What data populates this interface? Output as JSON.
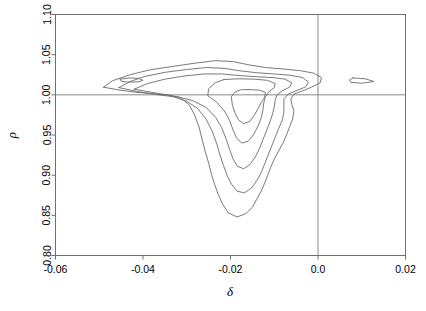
{
  "chart_data": {
    "type": "line",
    "subtype": "contour",
    "title": "",
    "xlabel": "δ",
    "ylabel": "ρ",
    "xlim": [
      -0.06,
      0.02
    ],
    "ylim": [
      0.8,
      1.1
    ],
    "grid": false,
    "legend": "none",
    "xticks": [
      -0.06,
      -0.04,
      -0.02,
      0.0,
      0.02
    ],
    "xticklabels": [
      "-0.06",
      "-0.04",
      "-0.02",
      "0.0",
      "0.02"
    ],
    "yticks": [
      0.8,
      0.85,
      0.9,
      0.95,
      1.0,
      1.05,
      1.1
    ],
    "yticklabels": [
      "0.80",
      "0.85",
      "0.90",
      "0.95",
      "1.00",
      "1.05",
      "1.10"
    ],
    "reference_lines": [
      {
        "orientation": "horizontal",
        "value": 1.0,
        "axis": "rho"
      },
      {
        "orientation": "vertical",
        "value": 0.0,
        "axis": "delta"
      }
    ],
    "contour_levels": [
      1,
      2,
      3,
      4,
      5
    ],
    "mode_estimate": {
      "delta": -0.0125,
      "rho": 0.975
    },
    "contours": [
      {
        "level": 1,
        "label": "outermost",
        "closed": true,
        "points": [
          [
            -0.049,
            1.0095
          ],
          [
            -0.047,
            1.0175
          ],
          [
            -0.043,
            1.025
          ],
          [
            -0.0385,
            1.031
          ],
          [
            -0.033,
            1.0355
          ],
          [
            -0.028,
            1.0395
          ],
          [
            -0.0235,
            1.0425
          ],
          [
            -0.0195,
            1.0415
          ],
          [
            -0.016,
            1.0375
          ],
          [
            -0.012,
            1.034
          ],
          [
            -0.0075,
            1.032
          ],
          [
            -0.004,
            1.03
          ],
          [
            -0.001,
            1.027
          ],
          [
            0.0008,
            1.0215
          ],
          [
            0.0005,
            1.015
          ],
          [
            -0.0015,
            1.0095
          ],
          [
            -0.0035,
            1.005
          ],
          [
            -0.0055,
            1.001
          ],
          [
            -0.0062,
            0.995
          ],
          [
            -0.006,
            0.988
          ],
          [
            -0.0055,
            0.98
          ],
          [
            -0.0058,
            0.97
          ],
          [
            -0.0065,
            0.96
          ],
          [
            -0.0072,
            0.95
          ],
          [
            -0.008,
            0.94
          ],
          [
            -0.009,
            0.93
          ],
          [
            -0.01,
            0.92
          ],
          [
            -0.0108,
            0.91
          ],
          [
            -0.0115,
            0.9
          ],
          [
            -0.0122,
            0.89
          ],
          [
            -0.013,
            0.88
          ],
          [
            -0.014,
            0.87
          ],
          [
            -0.015,
            0.86
          ],
          [
            -0.0165,
            0.852
          ],
          [
            -0.0185,
            0.848
          ],
          [
            -0.0205,
            0.853
          ],
          [
            -0.0218,
            0.864
          ],
          [
            -0.0228,
            0.876
          ],
          [
            -0.0236,
            0.888
          ],
          [
            -0.0243,
            0.9
          ],
          [
            -0.025,
            0.915
          ],
          [
            -0.0258,
            0.93
          ],
          [
            -0.0265,
            0.945
          ],
          [
            -0.0272,
            0.96
          ],
          [
            -0.0282,
            0.975
          ],
          [
            -0.0295,
            0.988
          ],
          [
            -0.0315,
            0.9965
          ],
          [
            -0.0345,
            1.0
          ],
          [
            -0.038,
            1.0015
          ],
          [
            -0.042,
            1.0035
          ],
          [
            -0.0455,
            1.006
          ],
          [
            -0.049,
            1.0095
          ]
        ]
      },
      {
        "level": 2,
        "label": "second",
        "closed": true,
        "points": [
          [
            -0.0455,
            1.009
          ],
          [
            -0.043,
            1.0165
          ],
          [
            -0.0395,
            1.023
          ],
          [
            -0.035,
            1.028
          ],
          [
            -0.03,
            1.0315
          ],
          [
            -0.0255,
            1.034
          ],
          [
            -0.0215,
            1.033
          ],
          [
            -0.018,
            1.03
          ],
          [
            -0.014,
            1.0275
          ],
          [
            -0.01,
            1.026
          ],
          [
            -0.0065,
            1.0245
          ],
          [
            -0.0035,
            1.0215
          ],
          [
            -0.0022,
            1.016
          ],
          [
            -0.0028,
            1.01
          ],
          [
            -0.0048,
            1.0055
          ],
          [
            -0.0068,
            1.001
          ],
          [
            -0.0078,
            0.995
          ],
          [
            -0.0078,
            0.987
          ],
          [
            -0.0078,
            0.978
          ],
          [
            -0.0082,
            0.968
          ],
          [
            -0.009,
            0.958
          ],
          [
            -0.0098,
            0.947
          ],
          [
            -0.0106,
            0.936
          ],
          [
            -0.0114,
            0.925
          ],
          [
            -0.0122,
            0.914
          ],
          [
            -0.013,
            0.903
          ],
          [
            -0.014,
            0.893
          ],
          [
            -0.0152,
            0.884
          ],
          [
            -0.0168,
            0.878
          ],
          [
            -0.0185,
            0.88
          ],
          [
            -0.0198,
            0.889
          ],
          [
            -0.0208,
            0.9
          ],
          [
            -0.0216,
            0.912
          ],
          [
            -0.0224,
            0.925
          ],
          [
            -0.0232,
            0.94
          ],
          [
            -0.0242,
            0.955
          ],
          [
            -0.0256,
            0.97
          ],
          [
            -0.0275,
            0.983
          ],
          [
            -0.03,
            0.992
          ],
          [
            -0.033,
            0.9975
          ],
          [
            -0.037,
            1.0005
          ],
          [
            -0.0412,
            1.004
          ],
          [
            -0.0455,
            1.009
          ]
        ]
      },
      {
        "level": 3,
        "label": "third",
        "closed": true,
        "points": [
          [
            -0.042,
            1.007
          ],
          [
            -0.039,
            1.014
          ],
          [
            -0.035,
            1.0195
          ],
          [
            -0.0305,
            1.0235
          ],
          [
            -0.026,
            1.026
          ],
          [
            -0.022,
            1.026
          ],
          [
            -0.018,
            1.024
          ],
          [
            -0.014,
            1.0225
          ],
          [
            -0.0105,
            1.0215
          ],
          [
            -0.0075,
            1.0195
          ],
          [
            -0.006,
            1.015
          ],
          [
            -0.0065,
            1.0095
          ],
          [
            -0.0082,
            1.005
          ],
          [
            -0.0094,
            1.0
          ],
          [
            -0.0098,
            0.993
          ],
          [
            -0.01,
            0.985
          ],
          [
            -0.0104,
            0.976
          ],
          [
            -0.011,
            0.966
          ],
          [
            -0.0118,
            0.955
          ],
          [
            -0.0126,
            0.944
          ],
          [
            -0.0134,
            0.933
          ],
          [
            -0.0144,
            0.922
          ],
          [
            -0.0156,
            0.913
          ],
          [
            -0.017,
            0.908
          ],
          [
            -0.0184,
            0.911
          ],
          [
            -0.0194,
            0.92
          ],
          [
            -0.0202,
            0.932
          ],
          [
            -0.021,
            0.945
          ],
          [
            -0.022,
            0.959
          ],
          [
            -0.0234,
            0.972
          ],
          [
            -0.0255,
            0.984
          ],
          [
            -0.0285,
            0.9925
          ],
          [
            -0.032,
            0.9975
          ],
          [
            -0.0368,
            1.002
          ],
          [
            -0.042,
            1.007
          ]
        ]
      },
      {
        "level": 4,
        "label": "fourth",
        "closed": true,
        "points": [
          [
            -0.0215,
            1.019
          ],
          [
            -0.018,
            1.02
          ],
          [
            -0.0145,
            1.0195
          ],
          [
            -0.0115,
            1.018
          ],
          [
            -0.0098,
            1.014
          ],
          [
            -0.01,
            1.009
          ],
          [
            -0.0112,
            1.004
          ],
          [
            -0.012,
            0.998
          ],
          [
            -0.0124,
            0.99
          ],
          [
            -0.0126,
            0.981
          ],
          [
            -0.013,
            0.971
          ],
          [
            -0.0138,
            0.96
          ],
          [
            -0.0148,
            0.95
          ],
          [
            -0.016,
            0.942
          ],
          [
            -0.0174,
            0.94
          ],
          [
            -0.0186,
            0.946
          ],
          [
            -0.0194,
            0.956
          ],
          [
            -0.0202,
            0.968
          ],
          [
            -0.0214,
            0.98
          ],
          [
            -0.0232,
            0.991
          ],
          [
            -0.0252,
            0.999
          ],
          [
            -0.025,
            1.0075
          ],
          [
            -0.0235,
            1.015
          ],
          [
            -0.0215,
            1.019
          ]
        ]
      },
      {
        "level": 5,
        "label": "innermost",
        "closed": true,
        "points": [
          [
            -0.016,
            1.0065
          ],
          [
            -0.0135,
            1.006
          ],
          [
            -0.012,
            1.003
          ],
          [
            -0.0122,
            0.997
          ],
          [
            -0.013,
            0.99
          ],
          [
            -0.0138,
            0.982
          ],
          [
            -0.0146,
            0.974
          ],
          [
            -0.0156,
            0.967
          ],
          [
            -0.017,
            0.964
          ],
          [
            -0.0182,
            0.969
          ],
          [
            -0.019,
            0.978
          ],
          [
            -0.0196,
            0.988
          ],
          [
            -0.0198,
            0.9975
          ],
          [
            -0.019,
            1.0035
          ],
          [
            -0.0175,
            1.0065
          ],
          [
            -0.016,
            1.0065
          ]
        ]
      },
      {
        "level": 1,
        "label": "left-small-loop",
        "closed": true,
        "points": [
          [
            -0.0452,
            1.0195
          ],
          [
            -0.0432,
            1.021
          ],
          [
            -0.041,
            1.0205
          ],
          [
            -0.04,
            1.018
          ],
          [
            -0.0412,
            1.016
          ],
          [
            -0.0435,
            1.0158
          ],
          [
            -0.045,
            1.017
          ],
          [
            -0.0452,
            1.0195
          ]
        ]
      },
      {
        "level": 1,
        "label": "right-island",
        "closed": true,
        "points": [
          [
            0.008,
            1.021
          ],
          [
            0.0108,
            1.02
          ],
          [
            0.0128,
            1.0165
          ],
          [
            0.01,
            1.0145
          ],
          [
            0.0075,
            1.0155
          ],
          [
            0.0072,
            1.0185
          ],
          [
            0.008,
            1.021
          ]
        ]
      }
    ]
  },
  "colors": {
    "background": "#ffffff",
    "contour_stroke": "#6b6b6b",
    "frame_stroke": "#6f6f6f",
    "reference_line": "#8a8a8a",
    "text": "#000000"
  }
}
